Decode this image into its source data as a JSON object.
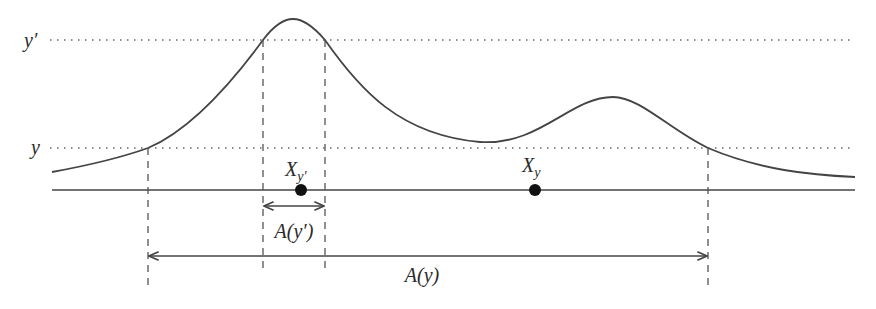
{
  "diagram": {
    "type": "level-set illustration",
    "levels": [
      {
        "id": "y_prime",
        "label": "y′",
        "ypx": 40
      },
      {
        "id": "y",
        "label": "y",
        "ypx": 148
      }
    ],
    "curve": {
      "description": "bimodal density curve with tall left peak and lower right peak",
      "color": "#444444"
    },
    "points": [
      {
        "id": "X_y_prime",
        "label_main": "X",
        "label_sub": "y′",
        "x": 301
      },
      {
        "id": "X_y",
        "label_main": "X",
        "label_sub": "y",
        "x": 535
      }
    ],
    "intervals": [
      {
        "id": "A_y_prime",
        "label": "A(y′)",
        "from": 263,
        "to": 325
      },
      {
        "id": "A_y",
        "label": "A(y)",
        "from": 148,
        "to": 708
      }
    ],
    "colors": {
      "stroke": "#444444",
      "dot": "#111111",
      "background": "#ffffff"
    }
  }
}
